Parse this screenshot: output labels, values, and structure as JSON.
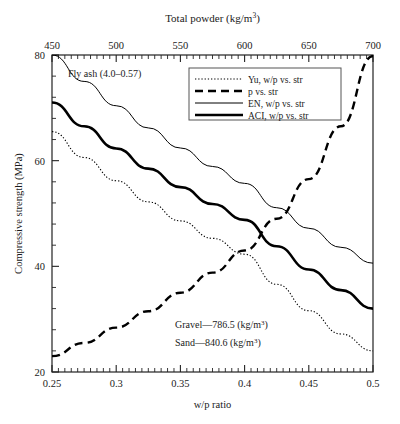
{
  "figure": {
    "top_axis_title_main": "Total powder (kg/m",
    "top_axis_title_exp": "3",
    "top_axis_title_end": ")",
    "x_axis_label": "w/p ratio",
    "y_axis_label": "Compressive strength (MPa)"
  },
  "annotations": {
    "fly_ash": "Fly ash (4.0–0.57)",
    "gravel_main": "Gravel—786.5 (kg/m",
    "gravel_exp": "3",
    "gravel_end": ")",
    "sand_main": "Sand—840.6 (kg/m",
    "sand_exp": "3",
    "sand_end": ")"
  },
  "legend": {
    "items": [
      {
        "label": "Yu, w/p vs. str",
        "style": "dotted",
        "color": "#000000"
      },
      {
        "label": "p vs. str",
        "style": "dashed",
        "color": "#000000"
      },
      {
        "label": "EN, w/p vs. str",
        "style": "thin",
        "color": "#000000"
      },
      {
        "label": "ACI, w/p vs. str",
        "style": "thick",
        "color": "#000000"
      }
    ]
  },
  "chart_data": {
    "type": "line",
    "title": "",
    "xlabel": "w/p ratio",
    "ylabel": "Compressive strength (MPa)",
    "xlim": [
      0.25,
      0.5
    ],
    "ylim": [
      20,
      80
    ],
    "xticks": [
      0.25,
      0.3,
      0.35,
      0.4,
      0.45,
      0.5
    ],
    "xticklabels": [
      "0.25",
      "0.3",
      "0.35",
      "0.4",
      "0.45",
      "0.5"
    ],
    "yticks": [
      20,
      40,
      60,
      80
    ],
    "yticklabels": [
      "20",
      "40",
      "60",
      "80"
    ],
    "minor_x_per_interval": 10,
    "minor_y_per_interval": 10,
    "top_axis": {
      "label": "Total powder (kg/m3)",
      "lim": [
        450,
        700
      ],
      "ticks": [
        450,
        500,
        550,
        600,
        650,
        700
      ],
      "ticklabels": [
        "450",
        "500",
        "550",
        "600",
        "650",
        "700"
      ],
      "minor_per_interval": 10
    },
    "grid": false,
    "legend_position": "top-right-inside",
    "x": [
      0.25,
      0.275,
      0.3,
      0.325,
      0.35,
      0.375,
      0.4,
      0.425,
      0.45,
      0.475,
      0.5
    ],
    "series": [
      {
        "name": "Yu, w/p vs. str",
        "style": "dotted",
        "values": [
          65.5,
          60.6,
          56.2,
          52.2,
          48.6,
          45.3,
          42.3,
          36.6,
          31.6,
          27.2,
          24.0
        ]
      },
      {
        "name": "p vs. str",
        "style": "dashed",
        "values": [
          23.0,
          25.5,
          28.4,
          31.5,
          35.0,
          38.8,
          43.0,
          49.0,
          56.5,
          66.5,
          79.8
        ]
      },
      {
        "name": "EN, w/p vs. str",
        "style": "thin",
        "values": [
          80.0,
          75.0,
          70.4,
          66.2,
          62.4,
          58.9,
          55.7,
          51.1,
          47.2,
          43.6,
          40.6
        ]
      },
      {
        "name": "ACI, w/p vs. str",
        "style": "thick",
        "values": [
          71.0,
          66.5,
          62.3,
          58.5,
          55.0,
          51.8,
          48.8,
          43.8,
          39.4,
          35.5,
          32.0
        ]
      }
    ]
  }
}
